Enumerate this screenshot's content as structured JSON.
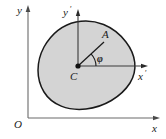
{
  "figure": {
    "colors": {
      "body_fill": "#d4d4d4",
      "body_stroke": "#1a1a1a",
      "axis_stroke": "#555555",
      "inner_axis_stroke": "#333333",
      "label_color": "#1a1a1a",
      "background": "#ffffff"
    },
    "global_frame": {
      "origin_label": "O",
      "x_axis_label": "x",
      "y_axis_label": "y"
    },
    "body_frame": {
      "center_label": "C",
      "x_axis_label": "x",
      "x_axis_prime": "′",
      "y_axis_label": "y",
      "y_axis_prime": "′"
    },
    "points": {
      "a_label": "A"
    },
    "angle": {
      "phi_label": "φ"
    }
  }
}
